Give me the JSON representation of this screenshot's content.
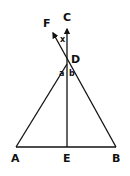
{
  "diagram": {
    "type": "geometry",
    "points": {
      "A": {
        "label": "A",
        "x": 16,
        "y": 147
      },
      "B": {
        "label": "B",
        "x": 116,
        "y": 147
      },
      "E": {
        "label": "E",
        "x": 67,
        "y": 147
      },
      "D": {
        "label": "D",
        "x": 67,
        "y": 64
      },
      "C": {
        "label": "C",
        "x": 67,
        "y": 26
      },
      "F": {
        "label": "F",
        "x": 52,
        "y": 31
      }
    },
    "angles": {
      "x": {
        "label": "x"
      },
      "a": {
        "label": "a"
      },
      "b": {
        "label": "b"
      }
    },
    "colors": {
      "stroke": "#111111",
      "background": "#ffffff"
    }
  }
}
